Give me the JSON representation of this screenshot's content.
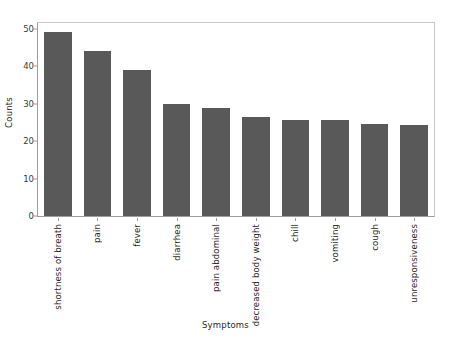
{
  "chart_data": {
    "type": "bar",
    "title": "",
    "subtitle": "",
    "xlabel": "Symptoms",
    "ylabel": "Counts",
    "categories": [
      "shortness of breath",
      "pain",
      "fever",
      "diarrhea",
      "pain abdominal",
      "decreased body weight",
      "chill",
      "vomiting",
      "cough",
      "unresponsiveness"
    ],
    "values": [
      49,
      44,
      39,
      30,
      28.8,
      26.5,
      25.5,
      25.5,
      24.5,
      24.3
    ],
    "ylim": [
      0,
      51.5
    ],
    "yticks": [
      0,
      10,
      20,
      30,
      40,
      50
    ],
    "ytick_labels": [
      "0",
      "10",
      "20",
      "30",
      "40",
      "50"
    ],
    "grid": false,
    "legend": null,
    "bar_color": "#595959",
    "background_color": "#ffffff",
    "axis_color": "#9d9d9d",
    "frame_color": "#c9c9c9",
    "bar_label_rotation": 90
  }
}
